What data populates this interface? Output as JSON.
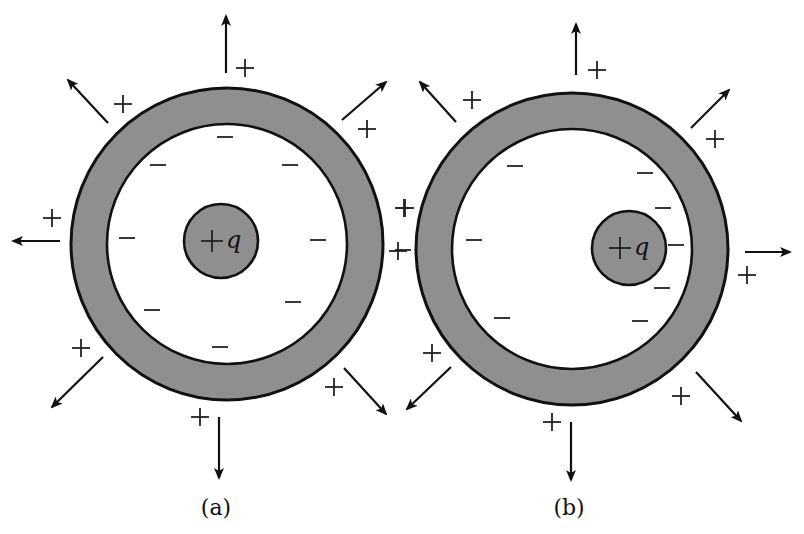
{
  "figure": {
    "colors": {
      "shell_fill": "#8f8f8f",
      "outline": "#111111",
      "background": "#ffffff"
    },
    "panels": [
      {
        "id": "a",
        "caption": "(a)",
        "caption_pos": [
          216,
          515
        ],
        "shell": {
          "cx": 227,
          "cy": 244,
          "outer_r": 156,
          "inner_r": 120
        },
        "charge": {
          "label_sign": "+",
          "label_var": "q",
          "cx": 221,
          "cy": 241,
          "r": 37
        },
        "arrows": [
          {
            "name": "up",
            "x1": 226,
            "y1": 73,
            "x2": 226,
            "y2": 16
          },
          {
            "name": "upper-left",
            "x1": 108,
            "y1": 123,
            "x2": 68,
            "y2": 80
          },
          {
            "name": "upper-right",
            "x1": 342,
            "y1": 120,
            "x2": 386,
            "y2": 82
          },
          {
            "name": "left",
            "x1": 60,
            "y1": 241,
            "x2": 13,
            "y2": 241
          },
          {
            "name": "lower-left",
            "x1": 103,
            "y1": 357,
            "x2": 52,
            "y2": 407
          },
          {
            "name": "lower-right",
            "x1": 344,
            "y1": 368,
            "x2": 386,
            "y2": 414
          },
          {
            "name": "down",
            "x1": 219,
            "y1": 417,
            "x2": 219,
            "y2": 478
          }
        ],
        "plus_marks": [
          [
            245,
            68
          ],
          [
            123,
            104
          ],
          [
            367,
            129
          ],
          [
            52,
            218
          ],
          [
            81,
            348
          ],
          [
            334,
            387
          ],
          [
            200,
            417
          ],
          [
            404,
            208
          ],
          [
            398,
            251
          ]
        ],
        "minus_marks": [
          [
            225,
            137
          ],
          [
            158,
            165
          ],
          [
            290,
            165
          ],
          [
            127,
            238
          ],
          [
            318,
            240
          ],
          [
            152,
            310
          ],
          [
            293,
            302
          ],
          [
            220,
            347
          ]
        ]
      },
      {
        "id": "b",
        "caption": "(b)",
        "caption_pos": [
          569,
          515
        ],
        "shell": {
          "cx": 572,
          "cy": 249,
          "outer_r": 156,
          "inner_r": 120
        },
        "charge": {
          "label_sign": "+",
          "label_var": "q",
          "cx": 629,
          "cy": 248,
          "r": 37
        },
        "arrows": [
          {
            "name": "up",
            "x1": 576,
            "y1": 75,
            "x2": 576,
            "y2": 24
          },
          {
            "name": "upper-left",
            "x1": 456,
            "y1": 122,
            "x2": 420,
            "y2": 82
          },
          {
            "name": "upper-right",
            "x1": 691,
            "y1": 128,
            "x2": 729,
            "y2": 90
          },
          {
            "name": "right",
            "x1": 745,
            "y1": 252,
            "x2": 790,
            "y2": 252
          },
          {
            "name": "lower-left",
            "x1": 451,
            "y1": 367,
            "x2": 407,
            "y2": 409
          },
          {
            "name": "lower-right",
            "x1": 696,
            "y1": 372,
            "x2": 741,
            "y2": 421
          },
          {
            "name": "down",
            "x1": 571,
            "y1": 422,
            "x2": 571,
            "y2": 480
          }
        ],
        "plus_marks": [
          [
            597,
            70
          ],
          [
            472,
            100
          ],
          [
            715,
            139
          ],
          [
            747,
            275
          ],
          [
            432,
            353
          ],
          [
            681,
            396
          ],
          [
            552,
            422
          ],
          [
            405,
            208
          ]
        ],
        "minus_marks": [
          [
            515,
            166
          ],
          [
            645,
            173
          ],
          [
            663,
            208
          ],
          [
            676,
            245
          ],
          [
            662,
            288
          ],
          [
            640,
            321
          ],
          [
            474,
            240
          ],
          [
            502,
            318
          ],
          [
            403,
            250
          ]
        ]
      }
    ]
  }
}
